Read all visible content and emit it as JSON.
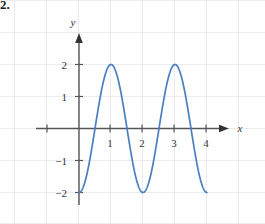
{
  "problem": {
    "number": "2."
  },
  "chart_data": {
    "type": "line",
    "title": "",
    "xlabel": "x",
    "ylabel": "y",
    "xlim": [
      -0.6,
      4.7
    ],
    "ylim": [
      -2.6,
      2.6
    ],
    "grid": true,
    "grid_style": "faint-square-notebook",
    "legend": null,
    "axis_color": "#555555",
    "curve_color": "#4a7fc1",
    "grid_color": "#ececf0",
    "x_ticks": [
      {
        "value": 1,
        "label": "1"
      },
      {
        "value": 2,
        "label": "2"
      },
      {
        "value": 3,
        "label": "3"
      },
      {
        "value": 4,
        "label": "4"
      }
    ],
    "x_ticks_unlabeled": [
      -1,
      0
    ],
    "y_ticks": [
      {
        "value": 2,
        "label": "2"
      },
      {
        "value": 1,
        "label": "1"
      },
      {
        "value": -1,
        "label": "−1"
      },
      {
        "value": -2,
        "label": "−2"
      }
    ],
    "series": [
      {
        "name": "y = -2 cos(2πx)",
        "amplitude": 2,
        "period": 2,
        "x_start": 0,
        "x_end": 4,
        "points": [
          {
            "x": 0.0,
            "y": -2.0
          },
          {
            "x": 0.1,
            "y": -1.62
          },
          {
            "x": 0.2,
            "y": -0.62
          },
          {
            "x": 0.25,
            "y": 0.0
          },
          {
            "x": 0.3,
            "y": 0.62
          },
          {
            "x": 0.4,
            "y": 1.62
          },
          {
            "x": 0.5,
            "y": 2.0
          },
          {
            "x": 0.6,
            "y": 1.62
          },
          {
            "x": 0.7,
            "y": 0.62
          },
          {
            "x": 0.75,
            "y": 0.0
          },
          {
            "x": 0.8,
            "y": -0.62
          },
          {
            "x": 0.9,
            "y": -1.62
          },
          {
            "x": 1.0,
            "y": -2.0
          },
          {
            "x": 1.1,
            "y": -1.62
          },
          {
            "x": 1.2,
            "y": -0.62
          },
          {
            "x": 1.25,
            "y": 0.0
          },
          {
            "x": 1.3,
            "y": 0.62
          },
          {
            "x": 1.4,
            "y": 1.62
          },
          {
            "x": 1.5,
            "y": 2.0
          },
          {
            "x": 1.6,
            "y": 1.62
          },
          {
            "x": 1.7,
            "y": 0.62
          },
          {
            "x": 1.75,
            "y": 0.0
          },
          {
            "x": 1.8,
            "y": -0.62
          },
          {
            "x": 1.9,
            "y": -1.62
          },
          {
            "x": 2.0,
            "y": -2.0
          }
        ]
      }
    ],
    "annotations": {
      "peaks": [
        {
          "x": 1,
          "y": 2
        },
        {
          "x": 3,
          "y": 2
        }
      ],
      "minima": [
        {
          "x": 0,
          "y": -2
        },
        {
          "x": 2,
          "y": -2
        },
        {
          "x": 4,
          "y": -2
        }
      ],
      "zeros": [
        0.5,
        1.5,
        2.5,
        3.5
      ]
    }
  }
}
